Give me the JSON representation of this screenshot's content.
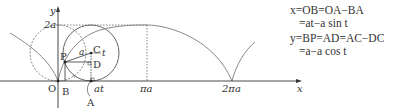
{
  "diagram": {
    "axes": {
      "x_label": "x",
      "y_label": "y",
      "origin_label": "O",
      "y_tick": "2a",
      "x_ticks": [
        "πa",
        "2πa"
      ]
    },
    "points": {
      "P": "P",
      "C": "C",
      "D": "D",
      "A": "A",
      "B": "B"
    },
    "segment_labels": {
      "radius": "a",
      "angle": "t",
      "arc": "at"
    },
    "colors": {
      "curve": "#888888",
      "axis": "#333333",
      "dotted": "#666666"
    }
  },
  "equations": {
    "line1": "x=OB=OA−BA",
    "line2": "=at−a sin t",
    "line3": "y=BP=AD=AC−DC",
    "line4": "=a−a cos t"
  }
}
